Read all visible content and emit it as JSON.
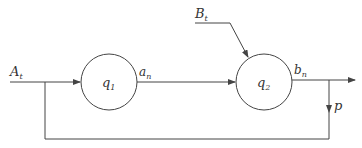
{
  "diagram": {
    "nodes": [
      {
        "id": "q1",
        "label": "q",
        "sub": "1"
      },
      {
        "id": "q2",
        "label": "q",
        "sub": "2"
      }
    ],
    "labels": {
      "input_a": {
        "main": "A",
        "sub": "t"
      },
      "input_b": {
        "main": "B",
        "sub": "t"
      },
      "out_a": {
        "main": "a",
        "sub": "n"
      },
      "out_b": {
        "main": "b",
        "sub": "n"
      },
      "feedback": {
        "main": "p"
      }
    },
    "colors": {
      "line": "#444444",
      "text": "#333333",
      "background": "#ffffff"
    }
  }
}
